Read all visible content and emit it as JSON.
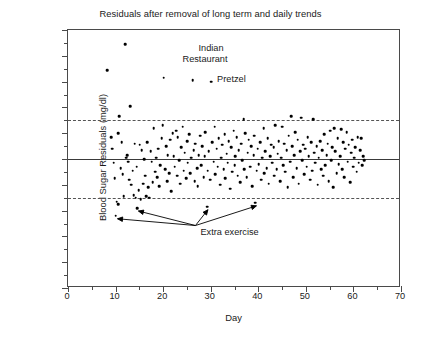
{
  "chart_data": {
    "type": "scatter",
    "title": "Residuals after removal of long term and daily trends",
    "xlabel": "Day",
    "ylabel": "Blood Sugar Residuals (mg/dl)",
    "xlim": [
      0,
      70
    ],
    "ylim": [
      -100,
      100
    ],
    "xticks": [
      0,
      10,
      20,
      30,
      40,
      50,
      60,
      70
    ],
    "yticks": [
      -100,
      -80,
      -60,
      -40,
      -20,
      0,
      20,
      40,
      60,
      80,
      100
    ],
    "x_minor_tick_step": 5,
    "y_minor_tick_step": 10,
    "grid": false,
    "legend": "none",
    "marker": "filled-circle",
    "marker_color": "#000000",
    "reference_lines": [
      {
        "name": "zero-line",
        "y": 0,
        "style": "solid",
        "color": "#3a3a3a"
      },
      {
        "name": "upper-limit",
        "y": 30,
        "style": "dashed",
        "color": "#555555"
      },
      {
        "name": "lower-limit",
        "y": -30,
        "style": "dashed",
        "color": "#555555"
      }
    ],
    "annotations": [
      {
        "name": "indian-restaurant",
        "text": "Indian",
        "text2": "Restaurant",
        "x": 26.6,
        "y": 85
      },
      {
        "name": "pretzel",
        "text": "Pretzel",
        "x": 30.5,
        "y": 61
      },
      {
        "name": "extra-exercise",
        "text": "Extra exercise",
        "x": 27,
        "y": -57,
        "arrow_targets": [
          [
            10.2,
            -44
          ],
          [
            14.6,
            -38
          ],
          [
            29.2,
            -37
          ],
          [
            39.4,
            -34
          ]
        ]
      }
    ],
    "points": [
      [
        8.2,
        69
      ],
      [
        9.1,
        17
      ],
      [
        9.3,
        8
      ],
      [
        9.6,
        -3
      ],
      [
        9.8,
        -15
      ],
      [
        10.0,
        -44
      ],
      [
        10.2,
        -33
      ],
      [
        10.5,
        -35
      ],
      [
        10.6,
        20
      ],
      [
        10.8,
        33
      ],
      [
        11.1,
        -7
      ],
      [
        11.3,
        13
      ],
      [
        11.5,
        -12
      ],
      [
        11.7,
        -29
      ],
      [
        12.0,
        89
      ],
      [
        12.2,
        1
      ],
      [
        12.4,
        3
      ],
      [
        12.6,
        -2
      ],
      [
        12.9,
        -16
      ],
      [
        13.1,
        41
      ],
      [
        13.3,
        -20
      ],
      [
        13.6,
        -9
      ],
      [
        13.8,
        -28
      ],
      [
        14.0,
        12
      ],
      [
        14.2,
        -30
      ],
      [
        14.4,
        -6
      ],
      [
        14.6,
        -38
      ],
      [
        14.9,
        -24
      ],
      [
        15.1,
        11
      ],
      [
        15.3,
        -31
      ],
      [
        15.5,
        7
      ],
      [
        15.8,
        -19
      ],
      [
        16.0,
        0
      ],
      [
        16.2,
        -13
      ],
      [
        16.4,
        -29
      ],
      [
        16.7,
        13
      ],
      [
        16.9,
        -22
      ],
      [
        17.1,
        -30
      ],
      [
        17.4,
        6
      ],
      [
        17.6,
        -2
      ],
      [
        17.8,
        -18
      ],
      [
        18.0,
        24
      ],
      [
        18.3,
        -10
      ],
      [
        18.5,
        1
      ],
      [
        18.7,
        -14
      ],
      [
        19.0,
        8
      ],
      [
        19.2,
        -21
      ],
      [
        19.4,
        -5
      ],
      [
        19.7,
        16
      ],
      [
        19.9,
        26
      ],
      [
        20.1,
        63
      ],
      [
        20.4,
        -8
      ],
      [
        20.6,
        10
      ],
      [
        20.8,
        -17
      ],
      [
        21.0,
        3
      ],
      [
        21.3,
        -11
      ],
      [
        21.5,
        15
      ],
      [
        21.7,
        -25
      ],
      [
        22.0,
        20
      ],
      [
        22.2,
        2
      ],
      [
        22.4,
        -6
      ],
      [
        22.7,
        22
      ],
      [
        22.9,
        -13
      ],
      [
        23.1,
        17
      ],
      [
        23.4,
        -1
      ],
      [
        23.6,
        -19
      ],
      [
        23.8,
        9
      ],
      [
        24.1,
        25
      ],
      [
        24.3,
        -9
      ],
      [
        24.5,
        5
      ],
      [
        24.8,
        -15
      ],
      [
        25.0,
        14
      ],
      [
        25.2,
        -3
      ],
      [
        25.5,
        19
      ],
      [
        25.7,
        -11
      ],
      [
        25.9,
        1
      ],
      [
        26.2,
        61
      ],
      [
        26.4,
        7
      ],
      [
        26.6,
        -17
      ],
      [
        26.8,
        12
      ],
      [
        27.1,
        -7
      ],
      [
        27.3,
        -21
      ],
      [
        27.5,
        3
      ],
      [
        27.8,
        18
      ],
      [
        28.0,
        -5
      ],
      [
        28.2,
        10
      ],
      [
        28.5,
        -14
      ],
      [
        28.7,
        2
      ],
      [
        28.9,
        21
      ],
      [
        29.2,
        -37
      ],
      [
        29.4,
        -9
      ],
      [
        29.6,
        6
      ],
      [
        29.9,
        -16
      ],
      [
        30.1,
        60
      ],
      [
        30.3,
        13
      ],
      [
        30.6,
        -2
      ],
      [
        30.8,
        25
      ],
      [
        31.0,
        -12
      ],
      [
        31.3,
        8
      ],
      [
        31.5,
        -6
      ],
      [
        31.7,
        16
      ],
      [
        32.0,
        -20
      ],
      [
        32.2,
        1
      ],
      [
        32.4,
        11
      ],
      [
        32.7,
        -8
      ],
      [
        32.9,
        19
      ],
      [
        33.1,
        -15
      ],
      [
        33.4,
        4
      ],
      [
        33.6,
        -3
      ],
      [
        33.8,
        14
      ],
      [
        34.1,
        -23
      ],
      [
        34.3,
        9
      ],
      [
        34.5,
        -10
      ],
      [
        34.8,
        22
      ],
      [
        35.0,
        -5
      ],
      [
        35.2,
        2
      ],
      [
        35.5,
        17
      ],
      [
        35.7,
        -13
      ],
      [
        35.9,
        7
      ],
      [
        36.2,
        -18
      ],
      [
        36.4,
        12
      ],
      [
        36.6,
        -1
      ],
      [
        36.9,
        31
      ],
      [
        37.1,
        -8
      ],
      [
        37.3,
        20
      ],
      [
        37.6,
        -14
      ],
      [
        37.8,
        5
      ],
      [
        38.0,
        15
      ],
      [
        38.3,
        -6
      ],
      [
        38.5,
        10
      ],
      [
        38.7,
        -21
      ],
      [
        39.0,
        3
      ],
      [
        39.2,
        18
      ],
      [
        39.4,
        -34
      ],
      [
        39.7,
        -9
      ],
      [
        39.9,
        8
      ],
      [
        40.1,
        -4
      ],
      [
        40.4,
        13
      ],
      [
        40.6,
        -16
      ],
      [
        40.8,
        1
      ],
      [
        41.1,
        24
      ],
      [
        41.3,
        -11
      ],
      [
        41.5,
        6
      ],
      [
        41.8,
        -7
      ],
      [
        42.0,
        16
      ],
      [
        42.2,
        -19
      ],
      [
        42.5,
        2
      ],
      [
        42.7,
        11
      ],
      [
        42.9,
        -3
      ],
      [
        43.2,
        9
      ],
      [
        43.4,
        -13
      ],
      [
        43.6,
        26
      ],
      [
        43.9,
        -8
      ],
      [
        44.1,
        4
      ],
      [
        44.3,
        14
      ],
      [
        44.6,
        -17
      ],
      [
        44.8,
        1
      ],
      [
        45.0,
        25
      ],
      [
        45.3,
        -5
      ],
      [
        45.5,
        12
      ],
      [
        45.7,
        -10
      ],
      [
        46.0,
        7
      ],
      [
        46.2,
        -22
      ],
      [
        46.4,
        18
      ],
      [
        46.7,
        -2
      ],
      [
        46.9,
        33
      ],
      [
        47.1,
        10
      ],
      [
        47.4,
        -14
      ],
      [
        47.6,
        3
      ],
      [
        47.8,
        21
      ],
      [
        48.1,
        -7
      ],
      [
        48.3,
        15
      ],
      [
        48.5,
        -19
      ],
      [
        48.8,
        6
      ],
      [
        49.0,
        32
      ],
      [
        49.2,
        -1
      ],
      [
        49.5,
        11
      ],
      [
        49.7,
        -12
      ],
      [
        49.9,
        8
      ],
      [
        50.2,
        -6
      ],
      [
        50.4,
        17
      ],
      [
        50.6,
        2
      ],
      [
        50.9,
        -16
      ],
      [
        51.1,
        13
      ],
      [
        51.3,
        -9
      ],
      [
        51.6,
        31
      ],
      [
        51.8,
        5
      ],
      [
        52.0,
        -3
      ],
      [
        52.3,
        10
      ],
      [
        52.5,
        -20
      ],
      [
        52.7,
        1
      ],
      [
        53.0,
        14
      ],
      [
        53.2,
        -8
      ],
      [
        53.4,
        7
      ],
      [
        53.7,
        -13
      ],
      [
        53.9,
        19
      ],
      [
        54.1,
        -5
      ],
      [
        54.4,
        3
      ],
      [
        54.6,
        12
      ],
      [
        54.8,
        -17
      ],
      [
        55.1,
        22
      ],
      [
        55.3,
        -1
      ],
      [
        55.5,
        9
      ],
      [
        55.8,
        -22
      ],
      [
        56.0,
        24
      ],
      [
        56.2,
        6
      ],
      [
        56.5,
        -11
      ],
      [
        56.7,
        16
      ],
      [
        56.9,
        -4
      ],
      [
        57.2,
        2
      ],
      [
        57.4,
        23
      ],
      [
        57.6,
        -8
      ],
      [
        57.9,
        13
      ],
      [
        58.1,
        -14
      ],
      [
        58.3,
        8
      ],
      [
        58.6,
        21
      ],
      [
        58.8,
        -2
      ],
      [
        59.0,
        11
      ],
      [
        59.3,
        -18
      ],
      [
        59.5,
        5
      ],
      [
        59.7,
        15
      ],
      [
        60.0,
        -6
      ],
      [
        60.2,
        1
      ],
      [
        60.4,
        9
      ],
      [
        60.7,
        -10
      ],
      [
        60.9,
        17
      ],
      [
        61.1,
        -3
      ],
      [
        61.4,
        7
      ],
      [
        61.6,
        16
      ],
      [
        61.8,
        -5
      ],
      [
        62.1,
        2
      ],
      [
        62.3,
        -1
      ]
    ]
  }
}
